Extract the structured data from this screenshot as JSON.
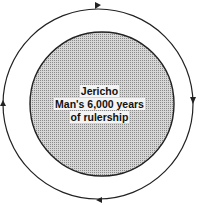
{
  "diagram": {
    "outer_cycle": {
      "direction": "clockwise",
      "arrows": [
        "top-right",
        "right-down",
        "bottom-left",
        "left-up"
      ]
    },
    "inner_circle": {
      "lines": [
        "Jericho",
        "Man's 6,000 years",
        "of rulership"
      ]
    },
    "colors": {
      "stroke": "#222222",
      "fill": "#b8b8b8",
      "background": "#ffffff"
    }
  }
}
